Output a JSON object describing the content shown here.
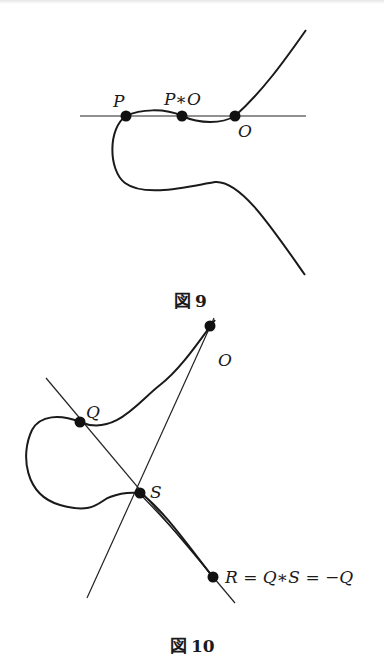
{
  "figures": [
    {
      "id": "figure-9",
      "caption": {
        "prefix": "図",
        "number": "9"
      },
      "points": [
        {
          "label": "P",
          "x": 126,
          "y": 116
        },
        {
          "label": "P∗O",
          "x": 182,
          "y": 116
        },
        {
          "label": "O",
          "x": 235,
          "y": 116
        }
      ],
      "line": {
        "x1": 80,
        "y1": 116,
        "x2": 306,
        "y2": 116
      }
    },
    {
      "id": "figure-10",
      "caption": {
        "prefix": "図",
        "number": "10"
      },
      "points": [
        {
          "label": "O",
          "x": 210,
          "y": 326
        },
        {
          "label": "Q",
          "x": 80,
          "y": 422
        },
        {
          "label": "S",
          "x": 140,
          "y": 493
        },
        {
          "label": "R",
          "x": 213,
          "y": 577
        }
      ],
      "equation": "R = Q∗S = −Q",
      "lines": [
        {
          "name": "line-QSR",
          "x1": 46,
          "y1": 378,
          "x2": 235,
          "y2": 603
        },
        {
          "name": "line-OS",
          "x1": 214,
          "y1": 318,
          "x2": 87,
          "y2": 598
        }
      ]
    }
  ],
  "labels": {
    "fig9_P": "P",
    "fig9_PO": "P∗O",
    "fig9_O": "O",
    "fig10_O": "O",
    "fig10_Q": "Q",
    "fig10_S": "S",
    "fig10_eq": "R = Q∗S = −Q"
  },
  "captions": {
    "fig9_prefix": "図",
    "fig9_number": "9",
    "fig10_prefix": "図",
    "fig10_number": "10"
  }
}
